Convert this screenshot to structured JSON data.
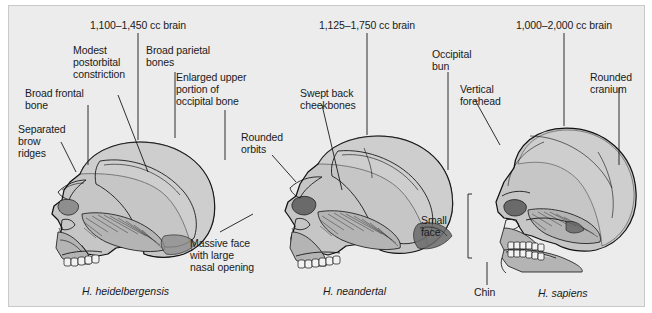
{
  "figure": {
    "background_color": "#ececec",
    "panel_border_color": "#c9c9c9",
    "text_color": "#1a1a1a",
    "bone_fill_color": "#c6c6c6"
  },
  "specimens": [
    {
      "id": "heidelbergensis",
      "species_label": "H. heidelbergensis",
      "brain_size_label": "1,100–1,450 cc brain",
      "annotations": [
        {
          "name": "modest-postorbital-constriction",
          "lines": [
            "Modest",
            "postorbital",
            "constriction"
          ]
        },
        {
          "name": "broad-parietal-bones",
          "lines": [
            "Broad parietal",
            "bones"
          ]
        },
        {
          "name": "enlarged-upper-occipital",
          "lines": [
            "Enlarged upper",
            "portion of",
            "occipital bone"
          ]
        },
        {
          "name": "broad-frontal-bone",
          "lines": [
            "Broad frontal",
            "bone"
          ]
        },
        {
          "name": "separated-brow-ridges",
          "lines": [
            "Separated",
            "brow",
            "ridges"
          ]
        },
        {
          "name": "massive-face-nasal-opening",
          "lines": [
            "Massive face",
            "with large",
            "nasal opening"
          ]
        }
      ]
    },
    {
      "id": "neandertal",
      "species_label": "H. neandertal",
      "brain_size_label": "1,125–1,750 cc brain",
      "annotations": [
        {
          "name": "swept-back-cheekbones",
          "lines": [
            "Swept back",
            "cheekbones"
          ]
        },
        {
          "name": "rounded-orbits",
          "lines": [
            "Rounded",
            "orbits"
          ]
        },
        {
          "name": "occipital-bun",
          "lines": [
            "Occipital",
            "bun"
          ]
        }
      ]
    },
    {
      "id": "sapiens",
      "species_label": "H. sapiens",
      "brain_size_label": "1,000–2,000 cc brain",
      "annotations": [
        {
          "name": "vertical-forehead",
          "lines": [
            "Vertical",
            "forehead"
          ]
        },
        {
          "name": "rounded-cranium",
          "lines": [
            "Rounded",
            "cranium"
          ]
        },
        {
          "name": "small-face",
          "lines": [
            "Small",
            "face"
          ]
        },
        {
          "name": "chin",
          "lines": [
            "Chin"
          ]
        }
      ]
    }
  ],
  "labels": {
    "brain1": "1,100–1,450 cc brain",
    "brain2": "1,125–1,750 cc brain",
    "brain3": "1,000–2,000 cc brain",
    "modest": "Modest",
    "postorbital": "postorbital",
    "constriction": "constriction",
    "broad_parietal": "Broad parietal",
    "bones": "bones",
    "enlarged_upper": "Enlarged upper",
    "portion_of": "portion of",
    "occipital_bone": "occipital bone",
    "broad_frontal": "Broad frontal",
    "bone": "bone",
    "separated": "Separated",
    "brow": "brow",
    "ridges": "ridges",
    "massive_face": "Massive face",
    "with_large": "with large",
    "nasal_opening": "nasal opening",
    "swept_back": "Swept back",
    "cheekbones": "cheekbones",
    "rounded": "Rounded",
    "orbits": "orbits",
    "occipital": "Occipital",
    "bun": "bun",
    "vertical": "Vertical",
    "forehead": "forehead",
    "rounded2": "Rounded",
    "cranium": "cranium",
    "small": "Small",
    "face": "face",
    "chin": "Chin",
    "sp1": "H. heidelbergensis",
    "sp2": "H. neandertal",
    "sp3": "H. sapiens"
  }
}
